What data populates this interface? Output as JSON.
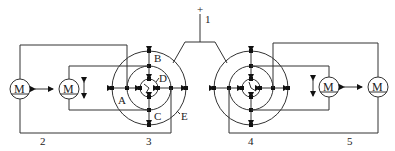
{
  "diagram": {
    "type": "mechanical-electrical schematic",
    "supply": {
      "polarity": "+",
      "label": "1"
    },
    "assemblies": [
      {
        "id": "left",
        "label": "3",
        "parts": [
          "A",
          "B",
          "C",
          "D",
          "E"
        ]
      },
      {
        "id": "right",
        "label": "4"
      }
    ],
    "motor_groups": [
      {
        "id": "left",
        "label": "2"
      },
      {
        "id": "right",
        "label": "5"
      }
    ],
    "motor_symbol": "M",
    "part_labels": {
      "A": "A",
      "B": "B",
      "C": "C",
      "D": "D",
      "E": "E"
    }
  }
}
